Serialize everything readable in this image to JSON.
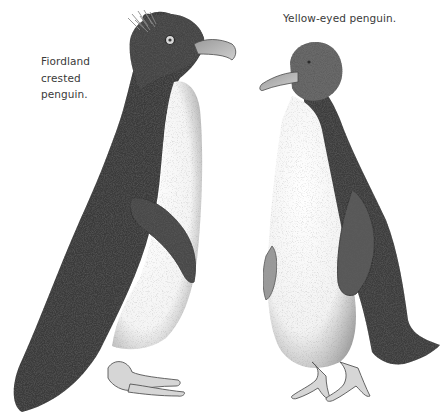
{
  "illustration": {
    "style": "pencil stipple drawing, grayscale",
    "background_color": "#ffffff",
    "ink_dark": "#2c2c2c",
    "ink_mid": "#6e6e6e",
    "ink_light": "#b5b5b5",
    "subjects": [
      {
        "id": "fiordland-crested-penguin",
        "caption_lines": [
          "Fiordland",
          "crested",
          "penguin."
        ],
        "facing": "right",
        "features": [
          "crest-feathers",
          "eye",
          "beak",
          "white-belly",
          "flipper",
          "feet"
        ]
      },
      {
        "id": "yellow-eyed-penguin",
        "caption_lines": [
          "Yellow-eyed penguin."
        ],
        "facing": "left",
        "features": [
          "eye",
          "beak",
          "white-belly",
          "flipper",
          "tail",
          "feet"
        ]
      }
    ]
  }
}
